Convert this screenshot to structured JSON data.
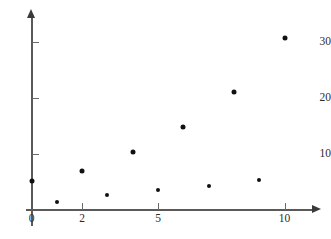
{
  "chart_data": {
    "type": "scatter",
    "title": "",
    "subtitle": "",
    "xlabel": "",
    "ylabel": "",
    "xlim": [
      0,
      11.5
    ],
    "ylim": [
      0,
      35
    ],
    "grid": false,
    "legend": null,
    "legend_position": "none",
    "x_ticks": [
      {
        "value": 0,
        "label": "0"
      },
      {
        "value": 2,
        "label": "2"
      },
      {
        "value": 5,
        "label": "5"
      },
      {
        "value": 10,
        "label": "10"
      }
    ],
    "y_ticks": [
      {
        "value": 10,
        "label": "10"
      },
      {
        "value": 20,
        "label": "20"
      },
      {
        "value": 30,
        "label": "30"
      }
    ],
    "series": [
      {
        "name": "upper-series",
        "marker": "filled-circle",
        "marker_size_px": 5,
        "color": "#111111",
        "points": [
          {
            "x": 0,
            "y": 5.1
          },
          {
            "x": 2,
            "y": 6.9
          },
          {
            "x": 4,
            "y": 10.2
          },
          {
            "x": 6,
            "y": 14.7
          },
          {
            "x": 8,
            "y": 21.0
          },
          {
            "x": 10,
            "y": 30.6
          }
        ]
      },
      {
        "name": "lower-series",
        "marker": "filled-circle",
        "marker_size_px": 4,
        "color": "#111111",
        "points": [
          {
            "x": 1,
            "y": 1.4
          },
          {
            "x": 3,
            "y": 2.6
          },
          {
            "x": 5,
            "y": 3.4
          },
          {
            "x": 7,
            "y": 4.2
          },
          {
            "x": 9,
            "y": 5.2
          }
        ]
      }
    ],
    "all_points": [
      {
        "x": 0,
        "y": 5.1
      },
      {
        "x": 1,
        "y": 1.4
      },
      {
        "x": 2,
        "y": 6.9
      },
      {
        "x": 3,
        "y": 2.6
      },
      {
        "x": 4,
        "y": 10.2
      },
      {
        "x": 5,
        "y": 3.4
      },
      {
        "x": 6,
        "y": 14.7
      },
      {
        "x": 7,
        "y": 4.2
      },
      {
        "x": 8,
        "y": 21.0
      },
      {
        "x": 9,
        "y": 5.2
      },
      {
        "x": 10,
        "y": 30.6
      }
    ]
  },
  "axes": {
    "x_axis_arrow": "arrow-right-icon",
    "y_axis_arrow": "arrow-up-icon",
    "axis_color": "#5a5a5a"
  }
}
